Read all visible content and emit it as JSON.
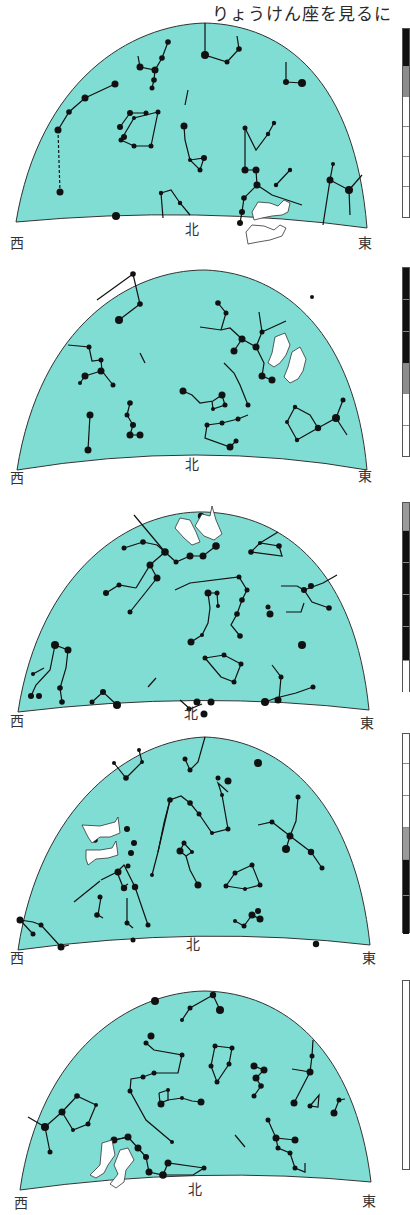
{
  "title": "りょうけん座を見るに",
  "sky_color": "#7FDDD3",
  "panels": [
    {
      "index": 1,
      "labels": {
        "west": "西",
        "north": "北",
        "east": "東"
      },
      "hounds_position": "near north-east horizon",
      "timebar": [
        {
          "color": "#111111"
        },
        {
          "color": "#8c8c8c"
        },
        {
          "color": "#ffffff"
        },
        {
          "color": "#ffffff"
        },
        {
          "color": "#ffffff"
        },
        {
          "color": "#ffffff"
        }
      ]
    },
    {
      "index": 2,
      "labels": {
        "west": "西",
        "north": "北",
        "east": "東"
      },
      "hounds_position": "upper east",
      "timebar": [
        {
          "color": "#111111"
        },
        {
          "color": "#111111"
        },
        {
          "color": "#111111"
        },
        {
          "color": "#8c8c8c"
        },
        {
          "color": "#ffffff"
        },
        {
          "color": "#ffffff"
        }
      ]
    },
    {
      "index": 3,
      "labels": {
        "west": "西",
        "north": "北",
        "east": "東"
      },
      "hounds_position": "zenith",
      "timebar": [
        {
          "color": "#9a9a9a"
        },
        {
          "color": "#111111"
        },
        {
          "color": "#111111"
        },
        {
          "color": "#111111"
        },
        {
          "color": "#111111"
        },
        {
          "color": "#ffffff"
        }
      ]
    },
    {
      "index": 4,
      "labels": {
        "west": "西",
        "north": "北",
        "east": "東"
      },
      "hounds_position": "upper west",
      "timebar": [
        {
          "color": "#ffffff"
        },
        {
          "color": "#ffffff"
        },
        {
          "color": "#ffffff"
        },
        {
          "color": "#9a9a9a"
        },
        {
          "color": "#111111"
        },
        {
          "color": "#111111"
        }
      ]
    },
    {
      "index": 5,
      "labels": {
        "west": "西",
        "north": "北",
        "east": "東"
      },
      "hounds_position": "near north-west horizon",
      "timebar": [
        {
          "color": "#ffffff"
        },
        {
          "color": "#ffffff"
        },
        {
          "color": "#ffffff"
        },
        {
          "color": "#ffffff"
        },
        {
          "color": "#ffffff"
        },
        {
          "color": "#ffffff"
        }
      ]
    }
  ]
}
